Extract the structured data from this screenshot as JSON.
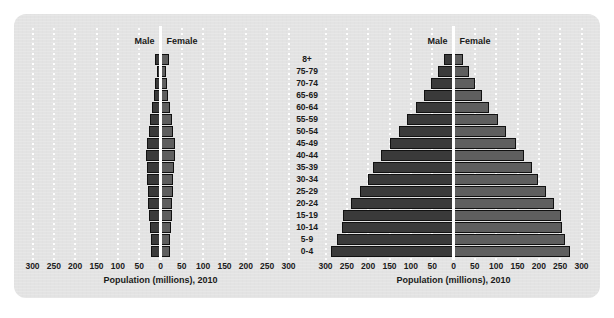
{
  "figure": {
    "background_color": "#e3e3e3",
    "male_color": "#3a3a3a",
    "female_color": "#5f5f5f",
    "gridline_color": "#ffffff"
  },
  "age_groups": [
    "8+",
    "75-79",
    "70-74",
    "65-69",
    "60-64",
    "55-59",
    "50-54",
    "45-49",
    "40-44",
    "35-39",
    "30-34",
    "25-29",
    "20-24",
    "15-19",
    "10-14",
    "5-9",
    "0-4"
  ],
  "axis": {
    "ticks": [
      300,
      250,
      200,
      150,
      100,
      50,
      0,
      50,
      100,
      150,
      200,
      250,
      300
    ],
    "tick_labels": [
      "300",
      "250",
      "200",
      "150",
      "100",
      "50",
      "0",
      "50",
      "100",
      "150",
      "200",
      "250",
      "300"
    ],
    "title": "Population (millions), 2010",
    "max": 300
  },
  "legend": {
    "male": "Male",
    "female": "Female"
  },
  "chart_data": [
    {
      "type": "bar",
      "title": "",
      "subtitle": "",
      "orientation": "population-pyramid",
      "panel": "left",
      "xlabel": "Population (millions), 2010",
      "ylabel": "",
      "xlim": [
        -300,
        300
      ],
      "grid": true,
      "legend_position": "top-center",
      "categories": [
        "8+",
        "75-79",
        "70-74",
        "65-69",
        "60-64",
        "55-59",
        "50-54",
        "45-49",
        "40-44",
        "35-39",
        "30-34",
        "25-29",
        "20-24",
        "15-19",
        "10-14",
        "5-9",
        "0-4"
      ],
      "series": [
        {
          "name": "Male",
          "values": [
            13,
            9,
            12,
            16,
            20,
            25,
            28,
            32,
            33,
            32,
            31,
            30,
            29,
            27,
            25,
            23,
            23
          ]
        },
        {
          "name": "Female",
          "values": [
            21,
            13,
            15,
            18,
            22,
            26,
            29,
            33,
            33,
            32,
            30,
            29,
            28,
            26,
            24,
            22,
            22
          ]
        }
      ]
    },
    {
      "type": "bar",
      "title": "",
      "subtitle": "",
      "orientation": "population-pyramid",
      "panel": "right",
      "xlabel": "Population (millions), 2010",
      "ylabel": "",
      "xlim": [
        -300,
        300
      ],
      "grid": true,
      "legend_position": "top-center",
      "categories": [
        "8+",
        "75-79",
        "70-74",
        "65-69",
        "60-64",
        "55-59",
        "50-54",
        "45-49",
        "40-44",
        "35-39",
        "30-34",
        "25-29",
        "20-24",
        "15-19",
        "10-14",
        "5-9",
        "0-4"
      ],
      "series": [
        {
          "name": "Male",
          "values": [
            22,
            37,
            52,
            70,
            88,
            108,
            128,
            148,
            170,
            188,
            200,
            220,
            240,
            260,
            262,
            272,
            288
          ]
        },
        {
          "name": "Female",
          "values": [
            22,
            36,
            50,
            66,
            84,
            104,
            124,
            146,
            166,
            184,
            198,
            216,
            236,
            252,
            254,
            262,
            272
          ]
        }
      ]
    }
  ]
}
